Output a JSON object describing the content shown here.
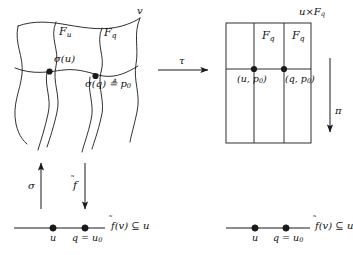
{
  "figure": {
    "type": "commutative-diagram"
  },
  "left_space": {
    "name": "v",
    "label": "v",
    "fiber_u_label": "F",
    "fiber_u_sub": "u",
    "fiber_q_label": "F",
    "fiber_q_sub": "q",
    "point_su_label": "σ(u)",
    "point_sq_label": "σ(q) ≜ p",
    "point_sq_sub": "0"
  },
  "right_space": {
    "title_prefix": "u",
    "title_times": "×",
    "title_F": "F",
    "title_sub": "q",
    "fiber_left_label": "F",
    "fiber_left_sub": "q",
    "fiber_right_label": "F",
    "fiber_right_sub": "q",
    "point_left_label": "(u, p",
    "point_left_sub": "0",
    "point_left_close": ")",
    "point_right_label": "(q, p",
    "point_right_sub": "0",
    "point_right_close": ")"
  },
  "arrows": {
    "tau": "τ",
    "pi": "π",
    "sigma": "σ",
    "f_tilde_base": "f",
    "f_tilde_mark": "̃"
  },
  "bottom_left_line": {
    "point_u": "u",
    "point_q": "q = u",
    "point_q_sub": "0",
    "set_label_f": "f",
    "set_label_rest": "(v) ⊆ u"
  },
  "bottom_right_line": {
    "point_u": "u",
    "point_q": "q = u",
    "point_q_sub": "0",
    "set_label_f": "f",
    "set_label_rest": "(v) ⊆ u"
  },
  "style": {
    "stroke": "#1a1a1a",
    "background": "#ffffff"
  }
}
